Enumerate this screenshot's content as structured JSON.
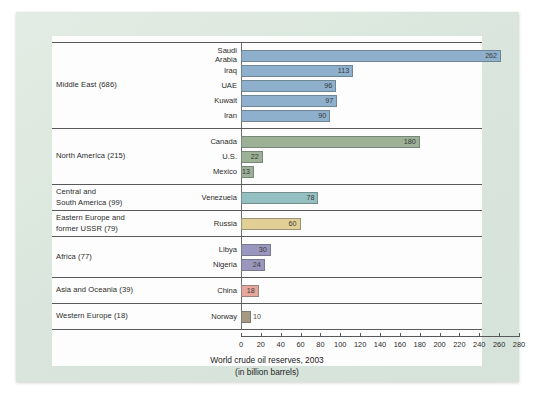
{
  "chart_data": {
    "type": "bar",
    "orientation": "horizontal",
    "title": "World crude oil reserves, 2003",
    "subtitle": "(in billion barrels)",
    "xlabel": "",
    "ylabel": "",
    "xlim": [
      0,
      280
    ],
    "xticks": [
      0,
      20,
      40,
      60,
      80,
      100,
      120,
      140,
      160,
      180,
      200,
      220,
      240,
      260,
      280
    ],
    "grid": false,
    "legend": false,
    "categories": [
      "Saudi Arabia",
      "Iraq",
      "UAE",
      "Kuwait",
      "Iran",
      "Canada",
      "U.S.",
      "Mexico",
      "Venezuela",
      "Russia",
      "Libya",
      "Nigeria",
      "China",
      "Norway"
    ],
    "values": [
      262,
      113,
      96,
      97,
      90,
      180,
      22,
      13,
      78,
      60,
      30,
      24,
      18,
      10
    ],
    "groups": [
      {
        "region": "Middle East (686)",
        "region_total": 686,
        "color": "#8fb0cd",
        "countries": [
          {
            "name": "Saudi\nArabia",
            "plain_name": "Saudi Arabia",
            "value": 262,
            "label": "262",
            "label_inside": true
          },
          {
            "name": "Iraq",
            "plain_name": "Iraq",
            "value": 113,
            "label": "113",
            "label_inside": true
          },
          {
            "name": "UAE",
            "plain_name": "UAE",
            "value": 96,
            "label": "96",
            "label_inside": true
          },
          {
            "name": "Kuwait",
            "plain_name": "Kuwait",
            "value": 97,
            "label": "97",
            "label_inside": true
          },
          {
            "name": "Iran",
            "plain_name": "Iran",
            "value": 90,
            "label": "90",
            "label_inside": true
          }
        ]
      },
      {
        "region": "North America (215)",
        "region_total": 215,
        "color": "#9cb195",
        "countries": [
          {
            "name": "Canada",
            "plain_name": "Canada",
            "value": 180,
            "label": "180",
            "label_inside": true
          },
          {
            "name": "U.S.",
            "plain_name": "U.S.",
            "value": 22,
            "label": "22",
            "label_inside": true
          },
          {
            "name": "Mexico",
            "plain_name": "Mexico",
            "value": 13,
            "label": "13",
            "label_inside": true
          }
        ]
      },
      {
        "region": "Central and\nSouth America (99)",
        "region_total": 99,
        "color": "#95c0c2",
        "countries": [
          {
            "name": "Venezuela",
            "plain_name": "Venezuela",
            "value": 78,
            "label": "78",
            "label_inside": true
          }
        ]
      },
      {
        "region": "Eastern Europe and\nformer USSR (79)",
        "region_total": 79,
        "color": "#e2cf96",
        "countries": [
          {
            "name": "Russia",
            "plain_name": "Russia",
            "value": 60,
            "label": "60",
            "label_inside": true
          }
        ]
      },
      {
        "region": "Africa (77)",
        "region_total": 77,
        "color": "#9a96bd",
        "countries": [
          {
            "name": "Libya",
            "plain_name": "Libya",
            "value": 30,
            "label": "30",
            "label_inside": true
          },
          {
            "name": "Nigeria",
            "plain_name": "Nigeria",
            "value": 24,
            "label": "24",
            "label_inside": true
          }
        ]
      },
      {
        "region": "Asia and Oceania (39)",
        "region_total": 39,
        "color": "#e6a79c",
        "countries": [
          {
            "name": "China",
            "plain_name": "China",
            "value": 18,
            "label": "18",
            "label_inside": true
          }
        ]
      },
      {
        "region": "Western Europe (18)",
        "region_total": 18,
        "color": "#a79a83",
        "countries": [
          {
            "name": "Norway",
            "plain_name": "Norway",
            "value": 10,
            "label": "10",
            "label_inside": false
          }
        ]
      }
    ]
  },
  "colors": {
    "page_background": "#dde8e0",
    "panel_background": "#fdfdfd",
    "rule": "#58595b",
    "text": "#2b2b2b"
  }
}
